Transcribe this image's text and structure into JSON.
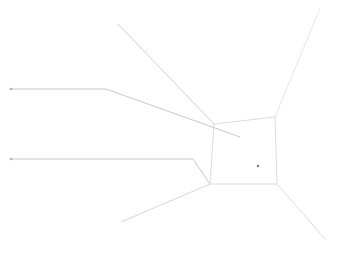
{
  "diagram": {
    "width": 349,
    "height": 264,
    "background": "#ffffff",
    "stroke_colors": {
      "leader": "#c8c8c8",
      "box": "#dcdcdc",
      "faint": "#e6e6e6",
      "dot": "#888888"
    },
    "leader_lines": [
      {
        "name": "upper-leader",
        "points": [
          [
            11,
            89
          ],
          [
            106,
            89
          ],
          [
            240,
            137
          ]
        ],
        "color": "#c8c8c8"
      },
      {
        "name": "lower-leader",
        "points": [
          [
            11,
            159
          ],
          [
            193,
            159
          ],
          [
            210,
            184
          ]
        ],
        "color": "#c8c8c8"
      }
    ],
    "box": {
      "name": "center-box",
      "points": [
        [
          214,
          124
        ],
        [
          275,
          117
        ],
        [
          277,
          184
        ],
        [
          210,
          184
        ]
      ],
      "color": "#dcdcdc"
    },
    "rays": [
      {
        "name": "ray-top-left",
        "from": [
          118,
          24
        ],
        "to": [
          214,
          124
        ],
        "color": "#d0d0d0"
      },
      {
        "name": "ray-top-right",
        "from": [
          320,
          8
        ],
        "to": [
          275,
          117
        ],
        "color": "#e6e6e6"
      },
      {
        "name": "ray-bottom-left",
        "from": [
          121,
          222
        ],
        "to": [
          210,
          184
        ],
        "color": "#d6d6d6"
      },
      {
        "name": "ray-bottom-right",
        "from": [
          326,
          240
        ],
        "to": [
          277,
          184
        ],
        "color": "#dedede"
      }
    ],
    "endpoint_dots": [
      {
        "name": "upper-leader-dot",
        "at": [
          11,
          89
        ],
        "r": 1.3,
        "color": "#b0b0b0"
      },
      {
        "name": "lower-leader-dot",
        "at": [
          11,
          159
        ],
        "r": 1.3,
        "color": "#b0b0b0"
      },
      {
        "name": "center-dot",
        "at": [
          258,
          166
        ],
        "r": 1.2,
        "color": "#777777"
      }
    ]
  }
}
